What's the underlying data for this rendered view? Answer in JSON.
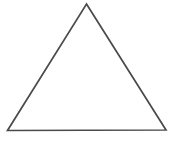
{
  "canvas": {
    "width": 175,
    "height": 148,
    "background_color": "#ffffff",
    "has_border": false
  },
  "figure": {
    "name": "triangle",
    "kind": "geometric-shape-outline",
    "stroke_color": "#4a4a4a",
    "fill_color": "none",
    "stroke_width": 1.7,
    "vertices": [
      {
        "label": "apex",
        "x": 86.5,
        "y": 4
      },
      {
        "label": "bottom-right",
        "x": 166,
        "y": 130
      },
      {
        "label": "bottom-left",
        "x": 7.5,
        "y": 130.5
      }
    ],
    "points_attr": "86.5,4 166,130 7.5,130.5",
    "sides": [
      {
        "name": "left-leg",
        "from": "bottom-left",
        "to": "apex"
      },
      {
        "name": "right-leg",
        "from": "apex",
        "to": "bottom-right"
      },
      {
        "name": "base",
        "from": "bottom-left",
        "to": "bottom-right"
      }
    ]
  },
  "labels": {
    "text_present": false,
    "items": []
  }
}
